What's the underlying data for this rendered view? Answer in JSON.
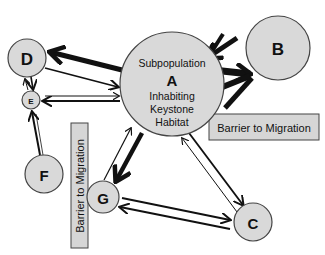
{
  "diagram": {
    "type": "metapopulation migration network",
    "nodes": {
      "A": {
        "label": "A",
        "top_text": "Subpopulation",
        "bottom_lines": [
          "Inhabiting",
          "Keystone",
          "Habitat"
        ]
      },
      "B": {
        "label": "B"
      },
      "C": {
        "label": "C"
      },
      "D": {
        "label": "D"
      },
      "E": {
        "label": "E"
      },
      "F": {
        "label": "F"
      },
      "G": {
        "label": "G"
      }
    },
    "barriers": [
      {
        "id": "barrier-horizontal",
        "label": "Barrier to Migration",
        "orientation": "horizontal"
      },
      {
        "id": "barrier-vertical",
        "label": "Barrier to Migration",
        "orientation": "vertical"
      }
    ],
    "edges": [
      {
        "from": "A",
        "to": "D",
        "weight": "heavy"
      },
      {
        "from": "D",
        "to": "A",
        "weight": "medium"
      },
      {
        "from": "E",
        "to": "A",
        "weight": "light"
      },
      {
        "from": "A",
        "to": "E",
        "weight": "medium"
      },
      {
        "from": "D",
        "to": "E",
        "weight": "medium"
      },
      {
        "from": "E",
        "to": "D",
        "weight": "light"
      },
      {
        "from": "F",
        "to": "E",
        "weight": "medium"
      },
      {
        "from": "B",
        "to": "A",
        "weight": "heavy"
      },
      {
        "from": "A",
        "to": "B",
        "weight": "very-heavy"
      },
      {
        "from": "G",
        "to": "A",
        "weight": "light"
      },
      {
        "from": "A",
        "to": "G",
        "weight": "heavy"
      },
      {
        "from": "A",
        "to": "C",
        "weight": "medium"
      },
      {
        "from": "C",
        "to": "A",
        "weight": "light"
      },
      {
        "from": "G",
        "to": "C",
        "weight": "medium"
      },
      {
        "from": "C",
        "to": "G",
        "weight": "medium"
      }
    ]
  }
}
